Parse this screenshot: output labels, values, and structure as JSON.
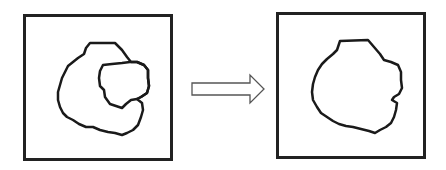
{
  "diagram": {
    "type": "before-after transformation",
    "panels": [
      {
        "id": "before",
        "description": "Irregular blob with an inner concave notch region (C-shaped outline with enclosed sub-region)"
      },
      {
        "id": "after",
        "description": "Single merged irregular blob outline"
      }
    ],
    "arrow": {
      "direction": "right",
      "style": "hollow outline"
    },
    "colors": {
      "stroke": "#222222",
      "background": "#ffffff"
    }
  }
}
